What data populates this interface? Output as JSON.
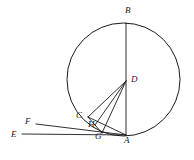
{
  "figure": {
    "background_color": "#ffffff",
    "stroke_color": "#1a1a1a"
  },
  "circle": {
    "name": "main-circle",
    "center_label": "D",
    "cx": 123.5,
    "cy": 79.5,
    "r": 56.5
  },
  "points": [
    {
      "id": "B",
      "label": "B",
      "x": 126,
      "y": 23,
      "label_x": 125,
      "label_y": 6,
      "on_circle": true
    },
    {
      "id": "D",
      "label": "D",
      "x": 126,
      "y": 81,
      "label_x": 131,
      "label_y": 75,
      "on_circle": false
    },
    {
      "id": "C",
      "label": "C",
      "x": 88,
      "y": 117,
      "label_x": 76,
      "label_y": 111,
      "on_circle": true
    },
    {
      "id": "H",
      "label": "H",
      "x": 95,
      "y": 125,
      "label_x": 88,
      "label_y": 120,
      "on_circle": false
    },
    {
      "id": "G",
      "label": "G",
      "x": 102,
      "y": 133,
      "label_x": 95,
      "label_y": 132,
      "on_circle": false
    },
    {
      "id": "A",
      "label": "A",
      "x": 126,
      "y": 135,
      "label_x": 124,
      "label_y": 136,
      "on_circle": true
    },
    {
      "id": "F",
      "label": "F",
      "x": 36,
      "y": 124,
      "label_x": 25,
      "label_y": 117,
      "on_circle": false
    },
    {
      "id": "E",
      "label": "E",
      "x": 22,
      "y": 134,
      "label_x": 11,
      "label_y": 130,
      "on_circle": false
    }
  ],
  "segments": [
    {
      "name": "segment-BA-diameter",
      "from": "B",
      "to": "A",
      "x1": 126,
      "y1": 23,
      "x2": 126,
      "y2": 135
    },
    {
      "name": "segment-DC-radius",
      "from": "D",
      "to": "C",
      "x1": 126,
      "y1": 81,
      "x2": 88,
      "y2": 117
    },
    {
      "name": "segment-DH",
      "from": "D",
      "to": "H",
      "x1": 126,
      "y1": 81,
      "x2": 95,
      "y2": 125
    },
    {
      "name": "segment-DG",
      "from": "D",
      "to": "G",
      "x1": 126,
      "y1": 81,
      "x2": 102,
      "y2": 133
    },
    {
      "name": "segment-CA-chord",
      "from": "C",
      "to": "A",
      "x1": 88,
      "y1": 117,
      "x2": 126,
      "y2": 135
    },
    {
      "name": "segment-FA-secant",
      "from": "F",
      "to": "A",
      "x1": 36,
      "y1": 124,
      "x2": 126,
      "y2": 135
    },
    {
      "name": "segment-EA-secant",
      "from": "E",
      "to": "A",
      "x1": 22,
      "y1": 134,
      "x2": 126,
      "y2": 135
    },
    {
      "name": "segment-CH-tick",
      "from": "C",
      "to": "H",
      "x1": 88,
      "y1": 117,
      "x2": 95,
      "y2": 125
    },
    {
      "name": "segment-HG",
      "from": "H",
      "to": "G",
      "x1": 95,
      "y1": 125,
      "x2": 102,
      "y2": 133
    }
  ]
}
